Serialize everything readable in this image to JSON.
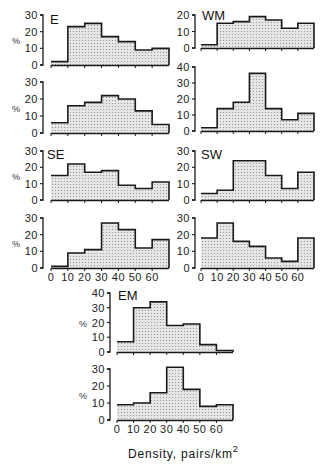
{
  "chart_data": {
    "type": "bar",
    "subtype": "histogram-step",
    "xlabel": "Density, pairs/km",
    "xlabel_superscript": "2",
    "ylabel": "%",
    "bin_edges": [
      0,
      10,
      20,
      30,
      40,
      50,
      60,
      70
    ],
    "x_tick_labels": [
      "0",
      "10",
      "20",
      "30",
      "40",
      "50",
      "60"
    ],
    "grid": false,
    "legend": null,
    "panels": [
      {
        "region": "E",
        "rows": [
          {
            "ylim": [
              0,
              30
            ],
            "yticks": [
              0,
              10,
              20,
              30
            ],
            "values": [
              2,
              23,
              25,
              17,
              14,
              9,
              10
            ]
          },
          {
            "ylim": [
              0,
              30
            ],
            "yticks": [
              0,
              10,
              20,
              30
            ],
            "values": [
              6,
              16,
              18,
              22,
              20,
              13,
              5
            ]
          }
        ]
      },
      {
        "region": "WM",
        "rows": [
          {
            "ylim": [
              0,
              20
            ],
            "yticks": [
              0,
              10,
              20
            ],
            "values": [
              2,
              15,
              16,
              19,
              17,
              12,
              15
            ]
          },
          {
            "ylim": [
              0,
              40
            ],
            "yticks": [
              0,
              10,
              20,
              30,
              40
            ],
            "values": [
              2,
              14,
              18,
              36,
              14,
              7,
              11
            ]
          }
        ]
      },
      {
        "region": "SE",
        "rows": [
          {
            "ylim": [
              0,
              30
            ],
            "yticks": [
              0,
              10,
              20,
              30
            ],
            "values": [
              15,
              22,
              17,
              18,
              9,
              7,
              11
            ]
          },
          {
            "ylim": [
              0,
              30
            ],
            "yticks": [
              0,
              10,
              20,
              30
            ],
            "values": [
              1,
              9,
              11,
              27,
              23,
              12,
              17
            ]
          }
        ]
      },
      {
        "region": "SW",
        "rows": [
          {
            "ylim": [
              0,
              30
            ],
            "yticks": [
              0,
              10,
              20,
              30
            ],
            "values": [
              4,
              6,
              24,
              24,
              15,
              7,
              17
            ]
          },
          {
            "ylim": [
              0,
              30
            ],
            "yticks": [
              0,
              10,
              20,
              30
            ],
            "values": [
              18,
              27,
              16,
              13,
              6,
              4,
              18
            ]
          }
        ]
      },
      {
        "region": "EM",
        "rows": [
          {
            "ylim": [
              0,
              40
            ],
            "yticks": [
              0,
              10,
              20,
              30,
              40
            ],
            "values": [
              7,
              30,
              34,
              18,
              19,
              5,
              1
            ]
          },
          {
            "ylim": [
              0,
              30
            ],
            "yticks": [
              0,
              10,
              20,
              30
            ],
            "values": [
              9,
              10,
              16,
              31,
              18,
              8,
              9
            ]
          }
        ]
      }
    ]
  },
  "layout": {
    "panels": [
      {
        "region": "E",
        "axis_x": 43,
        "x0": 51,
        "x1": 169,
        "label_x": 50,
        "label_y": 24,
        "x_ticklabels_row": -1,
        "rows": [
          {
            "y_top": 15,
            "y0": 65
          },
          {
            "y_top": 82,
            "y0": 133
          }
        ]
      },
      {
        "region": "WM",
        "axis_x": 195,
        "x0": 201,
        "x1": 314,
        "label_x": 202,
        "label_y": 20,
        "x_ticklabels_row": -1,
        "rows": [
          {
            "y_top": 15,
            "y0": 48
          },
          {
            "y_top": 67,
            "y0": 131
          }
        ]
      },
      {
        "region": "SE",
        "axis_x": 43,
        "x0": 51,
        "x1": 169,
        "label_x": 47,
        "label_y": 159,
        "x_ticklabels_row": 1,
        "ticklabel_y": 281,
        "rows": [
          {
            "y_top": 151,
            "y0": 200
          },
          {
            "y_top": 218,
            "y0": 268
          }
        ]
      },
      {
        "region": "SW",
        "axis_x": 195,
        "x0": 201,
        "x1": 314,
        "label_x": 201,
        "label_y": 159,
        "x_ticklabels_row": 1,
        "ticklabel_y": 281,
        "rows": [
          {
            "y_top": 151,
            "y0": 200
          },
          {
            "y_top": 218,
            "y0": 268
          }
        ]
      },
      {
        "region": "EM",
        "axis_x": 110,
        "x0": 117,
        "x1": 233,
        "label_x": 118,
        "label_y": 300,
        "x_ticklabels_row": 1,
        "ticklabel_y": 433,
        "rows": [
          {
            "y_top": 293,
            "y0": 352
          },
          {
            "y_top": 369,
            "y0": 420
          }
        ]
      }
    ],
    "xlabel_x": 128,
    "xlabel_y": 458,
    "colors": {
      "line": "#1a1a1a",
      "fill": "#e4e4e4",
      "dot": "#8c8c8c"
    }
  }
}
